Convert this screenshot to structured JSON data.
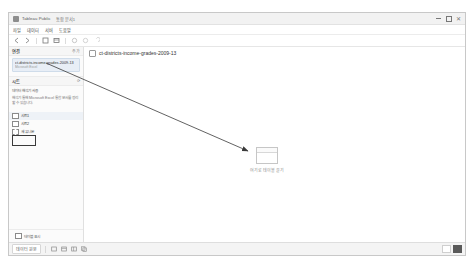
{
  "window": {
    "title": "Tableau Public",
    "subtitle": "통합 문서1",
    "controls": {
      "minimize": "–",
      "maximize": "□",
      "close": "✕"
    }
  },
  "menu": {
    "items": [
      {
        "label": "파일"
      },
      {
        "label": "데이터"
      },
      {
        "label": "서버"
      },
      {
        "label": "도움말"
      }
    ]
  },
  "toolbar": {
    "buttons": [
      {
        "name": "back-button",
        "glyph": "←"
      },
      {
        "name": "forward-button",
        "glyph": "→"
      },
      {
        "name": "save-button",
        "glyph": "▤"
      },
      {
        "name": "new-data-source-button",
        "glyph": "▦"
      },
      {
        "name": "refresh-button",
        "glyph": "↻"
      },
      {
        "name": "pause-button",
        "glyph": "⏸"
      },
      {
        "name": "undo-button",
        "glyph": "↶"
      }
    ]
  },
  "left_pane": {
    "connections": {
      "title": "연결",
      "action": "추가",
      "items": [
        {
          "name": "ct-districts-income-grades-2009-13",
          "type": "Microsoft Excel"
        }
      ]
    },
    "sheets": {
      "title": "시트",
      "action": "⟳",
      "help": [
        "데이터 해석기 사용",
        "해석기 통해 Microsoft Excel 통합 문서를 정리할 수 있습니다."
      ],
      "items": [
        {
          "label": "시트1",
          "icon": "sheet-icon",
          "selected": true
        },
        {
          "label": "시트2",
          "icon": "sheet-icon",
          "selected": false
        }
      ],
      "union_item": {
        "label": "새 유니온",
        "icon": "union-icon"
      }
    },
    "footer": {
      "label": "테이블 표시"
    }
  },
  "breadcrumb": {
    "label": "ct-districts-income-grades-2009-13"
  },
  "canvas": {
    "dropzone_caption": "여기로 테이블 끌기"
  },
  "statusbar": {
    "sheet_tab": "데이터 원본",
    "buttons": [
      {
        "name": "new-worksheet-button",
        "glyph": "▭"
      },
      {
        "name": "new-dashboard-button",
        "glyph": "▤"
      },
      {
        "name": "new-story-button",
        "glyph": "▥"
      },
      {
        "name": "duplicate-sheet-button",
        "glyph": "▦"
      }
    ]
  },
  "colors": {
    "accent": "#e8eef6",
    "border": "#c8c8c8",
    "arrow": "#3a3a3a"
  }
}
